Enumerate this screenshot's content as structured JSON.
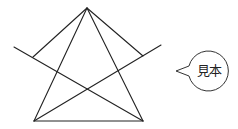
{
  "diagram": {
    "line_color": "#222222",
    "points": {
      "apex": [
        87,
        8
      ],
      "base_left": [
        34,
        121
      ],
      "base_right": [
        143,
        121
      ],
      "left_cross_start": [
        14,
        47
      ],
      "right_cross_end": [
        161,
        45
      ],
      "left_inner_end": [
        33,
        57
      ],
      "right_inner_end": [
        143,
        56
      ]
    }
  },
  "bubble": {
    "label": "見本",
    "border_color": "#333333"
  }
}
